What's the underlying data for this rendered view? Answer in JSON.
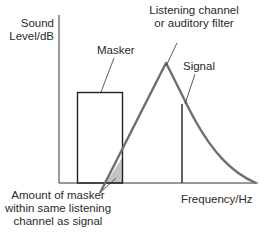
{
  "diagram": {
    "axes": {
      "y_label_line1": "Sound",
      "y_label_line2": "Level/dB",
      "x_label": "Frequency/Hz"
    },
    "labels": {
      "masker": "Masker",
      "filter_line1": "Listening channel",
      "filter_line2": "or auditory filter",
      "signal": "Signal",
      "overlap_line1": "Amount of masker",
      "overlap_line2": "within same listening",
      "overlap_line3": "channel as signal"
    },
    "colors": {
      "axis": "#333333",
      "masker_box": "#222222",
      "filter_curve": "#6e6e6e",
      "signal_line": "#222222",
      "overlap_fill": "#c4c4c4",
      "text": "#2a2a2a"
    }
  }
}
